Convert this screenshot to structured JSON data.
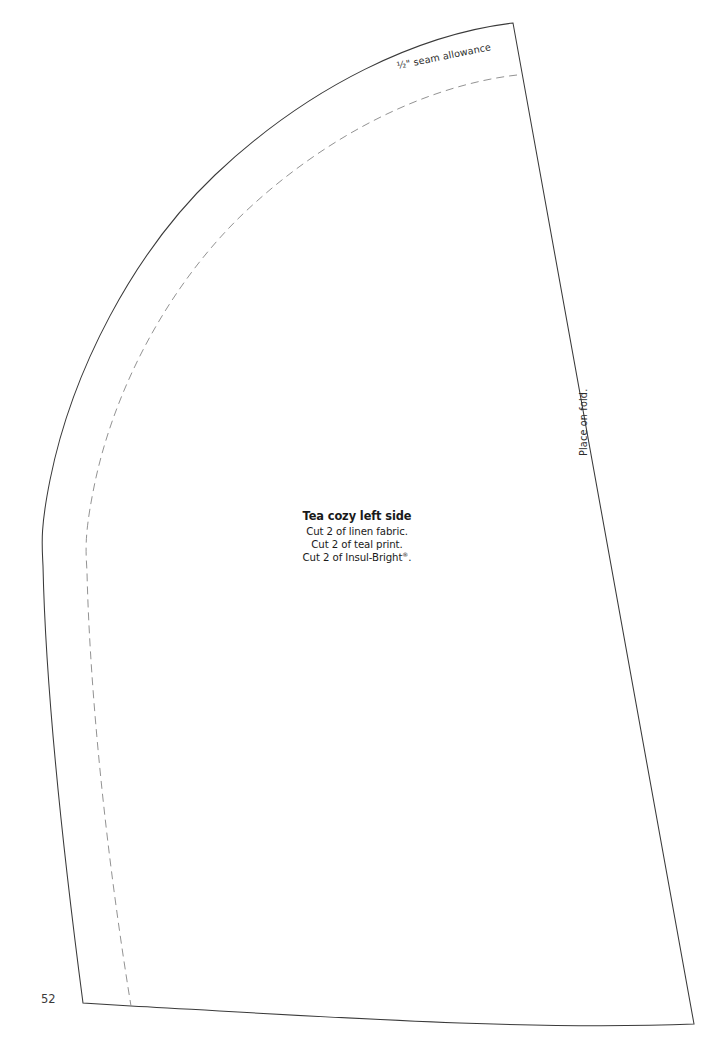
{
  "page": {
    "number": "52",
    "background_color": "#ffffff"
  },
  "pattern": {
    "name": "tea-cozy-left-side-pattern-piece",
    "outline_color": "#3a3a3a",
    "seam_line_color": "#8c8c8c",
    "fill_color": "#ffffff"
  },
  "labels": {
    "seam_allowance": "½\" seam allowance",
    "place_on_fold": "Place on fold."
  },
  "instructions": {
    "title": "Tea cozy left side",
    "lines": [
      "Cut 2 of linen fabric.",
      "Cut 2 of teal print.",
      "Cut 2 of Insul-Bright"
    ],
    "trademark_symbol": "®",
    "trademark_suffix": "."
  }
}
